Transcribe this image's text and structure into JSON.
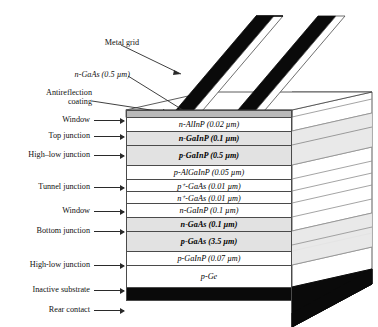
{
  "figure": {
    "type": "cross-section-schematic"
  },
  "callouts": {
    "metal_grid": "Metal grid",
    "n_gaas_cap": "n-GaAs (0.5 µm)",
    "antireflection_line1": "Antireflection",
    "antireflection_line2": "coating",
    "window_top": "Window",
    "top_junction": "Top junction",
    "high_low_junction_top": "High–low junction",
    "tunnel_junction": "Tunnel junction",
    "window_mid": "Window",
    "bottom_junction": "Bottom junction",
    "high_low_junction_bottom": "High-low junction",
    "inactive_substrate": "Inactive substrate",
    "rear_contact": "Rear contact"
  },
  "layers": [
    {
      "id": "arc",
      "text": "",
      "dopant": "",
      "material": "",
      "thickness": "",
      "style": "arc",
      "height": 7
    },
    {
      "id": "window-top",
      "text": "n-AlInP (0.02 µm)",
      "dopant": "n",
      "material": "AlInP",
      "thickness": "0.02 µm",
      "style": "plain",
      "height": 14
    },
    {
      "id": "n-gainp",
      "text": "n-GaInP (0.1 µm)",
      "dopant": "n",
      "material": "GaInP",
      "thickness": "0.1 µm",
      "style": "shaded",
      "height": 14
    },
    {
      "id": "p-gainp",
      "text": "p-GaInP (0.5 µm)",
      "dopant": "p",
      "material": "GaInP",
      "thickness": "0.5 µm",
      "style": "shaded",
      "height": 20
    },
    {
      "id": "p-algainp",
      "text": "p-AlGaInP (0.05 µm)",
      "dopant": "p",
      "material": "AlGaInP",
      "thickness": "0.05 µm",
      "style": "plain",
      "height": 14
    },
    {
      "id": "p-plus",
      "text": "p⁺-GaAs (0.01 µm)",
      "dopant": "p+",
      "material": "GaAs",
      "thickness": "0.01 µm",
      "style": "plain",
      "height": 12
    },
    {
      "id": "n-plus",
      "text": "n⁺-GaAs (0.01 µm)",
      "dopant": "n+",
      "material": "GaAs",
      "thickness": "0.01 µm",
      "style": "plain",
      "height": 12
    },
    {
      "id": "window-mid",
      "text": "n-GaInP (0.1 µm)",
      "dopant": "n",
      "material": "GaInP",
      "thickness": "0.1 µm",
      "style": "plain",
      "height": 14
    },
    {
      "id": "n-gaas",
      "text": "n-GaAs (0.1 µm)",
      "dopant": "n",
      "material": "GaAs",
      "thickness": "0.1 µm",
      "style": "shaded",
      "height": 14
    },
    {
      "id": "p-gaas",
      "text": "p-GaAs (3.5 µm)",
      "dopant": "p",
      "material": "GaAs",
      "thickness": "3.5 µm",
      "style": "shaded",
      "height": 20
    },
    {
      "id": "p-gainp-bsf",
      "text": "p-GaInP (0.07 µm)",
      "dopant": "p",
      "material": "GaInP",
      "thickness": "0.07 µm",
      "style": "plain",
      "height": 14
    },
    {
      "id": "p-ge",
      "text": "p-Ge",
      "dopant": "p",
      "material": "Ge",
      "thickness": "",
      "style": "plain",
      "height": 22
    },
    {
      "id": "rear",
      "text": "",
      "dopant": "",
      "material": "",
      "thickness": "",
      "style": "dark",
      "height": 14
    }
  ],
  "colors": {
    "line": "#4a4a4a",
    "shaded_fill": "#e2e2e2",
    "arc_fill": "#b9b9b9",
    "metal_fill": "#0a0a0a",
    "background": "#ffffff"
  }
}
